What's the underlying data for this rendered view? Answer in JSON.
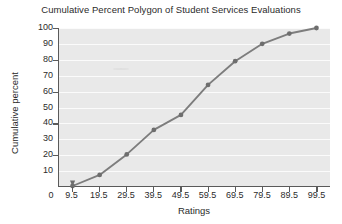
{
  "chart_data": {
    "type": "line",
    "title": "Cumulative Percent Polygon of Student Services Evaluations",
    "xlabel": "Ratings",
    "ylabel": "Cumulative percent",
    "x": [
      9.5,
      19.5,
      29.5,
      39.5,
      49.5,
      59.5,
      69.5,
      79.5,
      89.5,
      99.5
    ],
    "values": [
      0,
      7,
      20,
      35.5,
      45,
      64,
      79,
      90,
      96.5,
      100
    ],
    "xtick_labels": [
      "9.5",
      "19.5",
      "29.5",
      "39.5",
      "49.5",
      "59.5",
      "69.5",
      "79.5",
      "89.5",
      "99.5"
    ],
    "ytick_labels": [
      "100",
      "90",
      "80",
      "70",
      "60",
      "50",
      "40",
      "30",
      "20",
      "10"
    ],
    "origin_label": "0",
    "xlim": [
      4.5,
      104.5
    ],
    "ylim": [
      0,
      100
    ],
    "grid": true,
    "legend": "none",
    "series_color": "#7d7d7d",
    "marker_color": "#6e6e6e",
    "plot_background": "#e9e9e9",
    "gridline_color": "#fbfbfb",
    "axis_color": "#5a5a5a",
    "text_color": "#2b2b2b"
  }
}
